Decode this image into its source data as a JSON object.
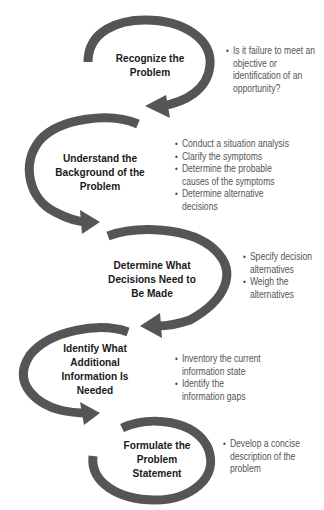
{
  "diagram": {
    "type": "process-flow",
    "arrow_color": "#555555",
    "steps": [
      {
        "title": "Recognize the Problem",
        "title_lines": [
          "Recognize the",
          "Problem"
        ],
        "bullets": [
          "Is it failure to meet an objective or identification of an opportunity?"
        ]
      },
      {
        "title": "Understand the Background of the Problem",
        "title_lines": [
          "Understand the",
          "Background of the",
          "Problem"
        ],
        "bullets": [
          "Conduct a situation analysis",
          "Clarify the symptoms",
          "Determine the probable causes of the symptoms",
          "Determine alternative decisions"
        ]
      },
      {
        "title": "Determine What Decisions Need to Be Made",
        "title_lines": [
          "Determine What",
          "Decisions Need to",
          "Be Made"
        ],
        "bullets": [
          "Specify decision alternatives",
          "Weigh the alternatives"
        ]
      },
      {
        "title": "Identify What Additional Information Is Needed",
        "title_lines": [
          "Identify What",
          "Additional",
          "Information Is",
          "Needed"
        ],
        "bullets": [
          "Inventory the current information state",
          "Identify the information gaps"
        ]
      },
      {
        "title": "Formulate the Problem Statement",
        "title_lines": [
          "Formulate the",
          "Problem",
          "Statement"
        ],
        "bullets": [
          "Develop a concise description of the problem"
        ]
      }
    ]
  }
}
